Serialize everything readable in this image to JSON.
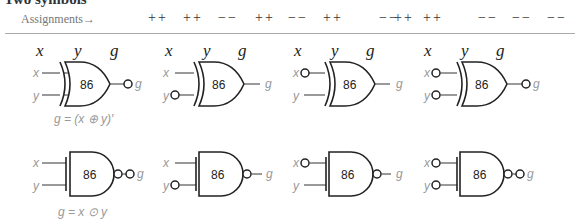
{
  "title": "Two symbols",
  "header": {
    "assignments_label": "Assignments→",
    "groups": [
      [
        "++",
        "++",
        "−−"
      ],
      [
        "++",
        "−−",
        "++"
      ],
      [
        "−−",
        "++",
        "++"
      ],
      [
        "−−",
        "−−",
        "−−"
      ]
    ],
    "columns": [
      "x",
      "y",
      "g"
    ]
  },
  "gate_label": "86",
  "pins": {
    "x": "x",
    "y": "y",
    "g": "g"
  },
  "xor_row": {
    "equation": "g = (x ⊕ y)′",
    "variants": [
      {
        "x_bubble": false,
        "y_bubble": false,
        "g_bubble": true
      },
      {
        "x_bubble": false,
        "y_bubble": true,
        "g_bubble": false
      },
      {
        "x_bubble": true,
        "y_bubble": false,
        "g_bubble": false
      },
      {
        "x_bubble": true,
        "y_bubble": true,
        "g_bubble": true
      }
    ]
  },
  "xnor_row": {
    "equation": "g = x ⊙ y",
    "variants": [
      {
        "x_bubble": false,
        "y_bubble": false,
        "g_bubble": true,
        "internal_bubble": true
      },
      {
        "x_bubble": false,
        "y_bubble": true,
        "g_bubble": false,
        "internal_bubble": true
      },
      {
        "x_bubble": true,
        "y_bubble": false,
        "g_bubble": false,
        "internal_bubble": true
      },
      {
        "x_bubble": true,
        "y_bubble": true,
        "g_bubble": true,
        "internal_bubble": true
      }
    ]
  }
}
